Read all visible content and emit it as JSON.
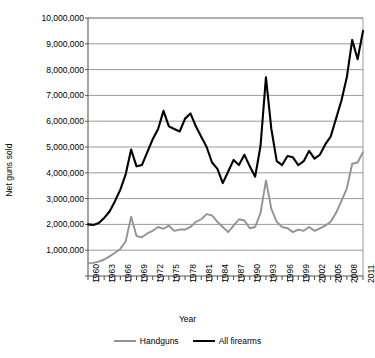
{
  "chart_data": {
    "type": "line",
    "title": "",
    "xlabel": "Year",
    "ylabel": "Net guns sold",
    "xlim": [
      1960,
      2011
    ],
    "ylim": [
      0,
      10000000
    ],
    "grid": true,
    "legend_position": "bottom",
    "ytick_labels": [
      "10,000,000",
      "9,000,000",
      "8,000,000",
      "7,000,000",
      "6,000,000",
      "5,000,000",
      "4,000,000",
      "3,000,000",
      "2,000,000",
      "1,000,000"
    ],
    "ytick_values": [
      10000000,
      9000000,
      8000000,
      7000000,
      6000000,
      5000000,
      4000000,
      3000000,
      2000000,
      1000000
    ],
    "xtick_labels": [
      "1960",
      "1963",
      "1966",
      "1969",
      "1972",
      "1975",
      "1978",
      "1981",
      "1984",
      "1987",
      "1990",
      "1993",
      "1996",
      "1999",
      "2002",
      "2005",
      "2008",
      "2011"
    ],
    "xtick_values": [
      1960,
      1963,
      1966,
      1969,
      1972,
      1975,
      1978,
      1981,
      1984,
      1987,
      1990,
      1993,
      1996,
      1999,
      2002,
      2005,
      2008,
      2011
    ],
    "x": [
      1960,
      1961,
      1962,
      1963,
      1964,
      1965,
      1966,
      1967,
      1968,
      1969,
      1970,
      1971,
      1972,
      1973,
      1974,
      1975,
      1976,
      1977,
      1978,
      1979,
      1980,
      1981,
      1982,
      1983,
      1984,
      1985,
      1986,
      1987,
      1988,
      1989,
      1990,
      1991,
      1992,
      1993,
      1994,
      1995,
      1996,
      1997,
      1998,
      1999,
      2000,
      2001,
      2002,
      2003,
      2004,
      2005,
      2006,
      2007,
      2008,
      2009,
      2010,
      2011
    ],
    "series": [
      {
        "name": "All firearms",
        "color": "#000000",
        "values": [
          2000000,
          1980000,
          2050000,
          2250000,
          2500000,
          2900000,
          3350000,
          3950000,
          4900000,
          4250000,
          4300000,
          4800000,
          5300000,
          5700000,
          6400000,
          5800000,
          5700000,
          5600000,
          6100000,
          6300000,
          5800000,
          5400000,
          5000000,
          4400000,
          4150000,
          3600000,
          4050000,
          4500000,
          4300000,
          4700000,
          4250000,
          3850000,
          5050000,
          7700000,
          5700000,
          4450000,
          4300000,
          4650000,
          4600000,
          4300000,
          4450000,
          4850000,
          4550000,
          4700000,
          5100000,
          5400000,
          6100000,
          6800000,
          7700000,
          9150000,
          8400000,
          9500000
        ]
      },
      {
        "name": "Handguns",
        "color": "#939393",
        "values": [
          500000,
          510000,
          560000,
          640000,
          760000,
          900000,
          1050000,
          1350000,
          2300000,
          1550000,
          1500000,
          1650000,
          1750000,
          1900000,
          1830000,
          1950000,
          1750000,
          1800000,
          1800000,
          1900000,
          2100000,
          2200000,
          2400000,
          2350000,
          2100000,
          1900000,
          1700000,
          1950000,
          2200000,
          2150000,
          1850000,
          1900000,
          2450000,
          3700000,
          2600000,
          2100000,
          1900000,
          1850000,
          1700000,
          1800000,
          1750000,
          1900000,
          1750000,
          1850000,
          1950000,
          2100000,
          2450000,
          2900000,
          3400000,
          4350000,
          4400000,
          4800000
        ]
      }
    ]
  },
  "axis": {
    "ylabel": "Net guns sold",
    "xlabel": "Year"
  },
  "legend": {
    "items": [
      {
        "label": "Handguns",
        "color": "#939393"
      },
      {
        "label": "All firearms",
        "color": "#000000"
      }
    ]
  }
}
